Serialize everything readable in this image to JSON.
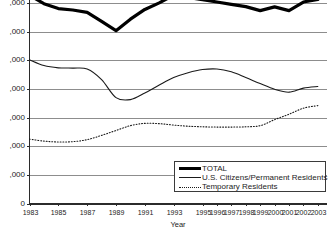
{
  "chart_data": {
    "type": "line",
    "title": "",
    "xlabel": "Year",
    "ylabel": "",
    "grid": true,
    "legend_position": "bottom-right",
    "x": [
      1983,
      1984,
      1985,
      1986,
      1987,
      1988,
      1989,
      1990,
      1991,
      1992,
      1993,
      1994,
      1995,
      1996,
      1997,
      1998,
      1999,
      2000,
      2001,
      2002,
      2003
    ],
    "x_tick_labels": [
      "1983",
      "1985",
      "1987",
      "1989",
      "1991",
      "1993",
      "1995",
      "1996",
      "1997",
      "1998",
      "1999",
      "2000",
      "2001",
      "2002",
      "2003"
    ],
    "x_tick_values": [
      1983,
      1985,
      1987,
      1989,
      1991,
      1993,
      1995,
      1996,
      1997,
      1998,
      1999,
      2000,
      2001,
      2002,
      2003
    ],
    "y_tick_labels": [
      ",000",
      ",000",
      ",000",
      ",000",
      ",000",
      ",000",
      ",000",
      "0"
    ],
    "y_tick_values": [
      7000,
      6000,
      5000,
      4000,
      3000,
      2000,
      1000,
      0
    ],
    "ylim": [
      0,
      7250
    ],
    "xlim": [
      1983,
      2003.6
    ],
    "series": [
      {
        "name": "TOTAL",
        "style": "thick-solid",
        "color": "#000000",
        "values": [
          7280,
          6980,
          6810,
          6760,
          6680,
          6360,
          6040,
          6440,
          6780,
          7010,
          7280,
          7200,
          7120,
          7040,
          6960,
          6880,
          6740,
          6870,
          6740,
          7040,
          7130
        ]
      },
      {
        "name": "U.S. Citizens/Permanent Residents",
        "style": "thin-solid",
        "color": "#1a1a1a",
        "values": [
          5020,
          4820,
          4740,
          4730,
          4700,
          4330,
          3700,
          3630,
          3860,
          4140,
          4400,
          4570,
          4680,
          4700,
          4600,
          4400,
          4190,
          3990,
          3890,
          4030,
          4090
        ]
      },
      {
        "name": "Temporary Residents",
        "style": "dotted",
        "color": "#1a1a1a",
        "values": [
          2250,
          2180,
          2150,
          2160,
          2230,
          2380,
          2550,
          2720,
          2800,
          2790,
          2740,
          2700,
          2680,
          2670,
          2670,
          2680,
          2720,
          2930,
          3120,
          3330,
          3420
        ]
      }
    ]
  },
  "axis": {
    "x_title": "Year"
  },
  "legend": {
    "items": [
      {
        "label": "TOTAL"
      },
      {
        "label": "U.S. Citizens/Permanent Residents"
      },
      {
        "label": "Temporary Residents"
      }
    ]
  }
}
